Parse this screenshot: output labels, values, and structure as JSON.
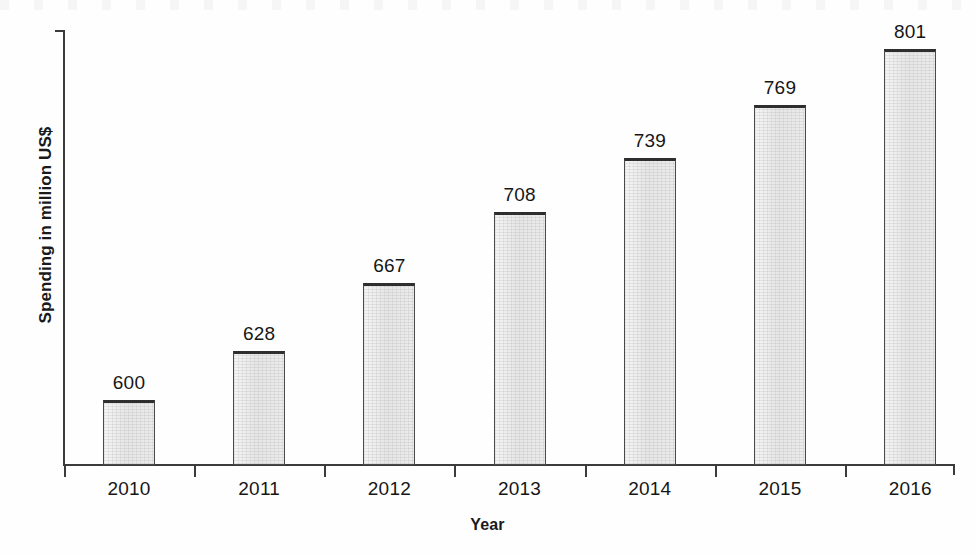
{
  "chart_data": {
    "type": "bar",
    "title": "",
    "xlabel": "Year",
    "ylabel": "Spending in million US$",
    "categories": [
      "2010",
      "2011",
      "2012",
      "2013",
      "2014",
      "2015",
      "2016"
    ],
    "values": [
      600,
      628,
      667,
      708,
      739,
      769,
      801
    ],
    "value_labels": [
      "600",
      "628",
      "667",
      "708",
      "739",
      "769",
      "801"
    ],
    "series": [
      {
        "name": "Spending",
        "values": [
          600,
          628,
          667,
          708,
          739,
          769,
          801
        ]
      }
    ],
    "ylim": [
      563,
      812
    ],
    "y_tick_labels": [],
    "x_tick_labels": [
      "2010",
      "2011",
      "2012",
      "2013",
      "2014",
      "2015",
      "2016"
    ],
    "grid": false,
    "legend": false,
    "legend_position": "none",
    "value_labels_shown": true,
    "bar_fill_color": "#e9e9e9",
    "bar_border_color": "#4a4a4a",
    "axis_color": "#3b3b3b",
    "text_color": "#161616",
    "background_color": "#fefefe"
  },
  "axes": {
    "y_title": "Spending in million US$",
    "x_title": "Year"
  }
}
